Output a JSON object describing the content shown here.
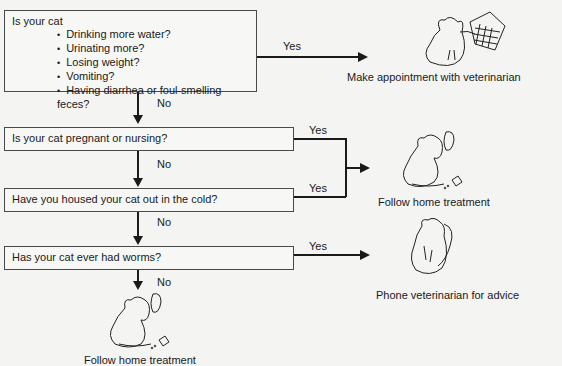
{
  "flowchart": {
    "question1": {
      "intro": "Is your cat",
      "bullets": [
        "Drinking more water?",
        "Urinating more?",
        "Losing weight?",
        "Vomiting?",
        "Having diarrhea or foul-smelling feces?"
      ]
    },
    "question2": "Is your cat pregnant or nursing?",
    "question3": "Have you housed your cat out in the cold?",
    "question4": "Has your cat ever had worms?",
    "yes_label": "Yes",
    "no_label": "No"
  },
  "outcomes": {
    "appointment": {
      "caption": "Make appointment with veterinarian",
      "icon": "cat-calendar-illustration"
    },
    "home_treatment": {
      "caption": "Follow home treatment",
      "icon": "cat-drinking-illustration"
    },
    "phone_vet": {
      "caption": "Phone veterinarian for advice",
      "icon": "cat-phone-illustration"
    },
    "bottom_home_treatment": {
      "caption": "Follow home treatment",
      "icon": "cat-drinking-illustration"
    }
  },
  "colors": {
    "line": "#1a1a1a",
    "box_border": "#4a4a4a",
    "background": "#f4f4f2"
  }
}
